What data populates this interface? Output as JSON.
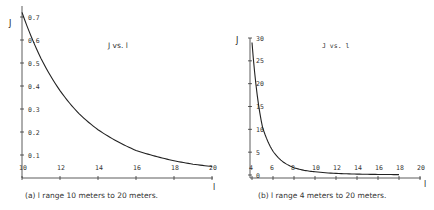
{
  "chart_data": [
    {
      "type": "line",
      "panel": "a",
      "title": "J vs. l",
      "xlabel": "l",
      "ylabel": "J",
      "caption": "(a) l range 10 meters to 20 meters.",
      "xlim": [
        10,
        20
      ],
      "ylim": [
        0,
        0.7
      ],
      "x_ticks": [
        "10",
        "12",
        "14",
        "16",
        "18",
        "20"
      ],
      "y_ticks": [
        "0.1",
        "0.2",
        "0.3",
        "0.4",
        "0.5",
        "0.6",
        "0.7"
      ],
      "grid": false,
      "x": [
        10,
        11,
        12,
        13,
        14,
        15,
        16,
        17,
        18,
        19,
        20
      ],
      "values": [
        0.72,
        0.52,
        0.38,
        0.28,
        0.21,
        0.16,
        0.12,
        0.095,
        0.075,
        0.06,
        0.05
      ]
    },
    {
      "type": "line",
      "panel": "b",
      "title": "J vs. l",
      "xlabel": "l",
      "ylabel": "J",
      "caption": "(b) l range 4 meters to 20 meters.",
      "xlim": [
        4,
        20
      ],
      "ylim": [
        0,
        30
      ],
      "x_ticks": [
        "4",
        "6",
        "8",
        "10",
        "12",
        "14",
        "16",
        "18",
        "20"
      ],
      "y_ticks": [
        "0",
        "5",
        "10",
        "15",
        "20",
        "25",
        "30"
      ],
      "grid": false,
      "x": [
        4,
        5,
        6,
        7,
        8,
        9,
        10,
        12,
        14,
        16,
        18
      ],
      "values": [
        29,
        10.5,
        5.2,
        2.8,
        1.6,
        1.0,
        0.7,
        0.35,
        0.2,
        0.12,
        0.08
      ]
    }
  ]
}
